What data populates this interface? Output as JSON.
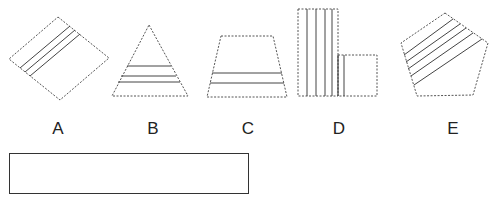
{
  "question": {
    "options": [
      {
        "id": "A",
        "label": "A",
        "shape": "rotated-square",
        "shaded_stripes": 3
      },
      {
        "id": "B",
        "label": "B",
        "shape": "triangle",
        "shaded_stripes": 3
      },
      {
        "id": "C",
        "label": "C",
        "shape": "trapezoid",
        "shaded_stripes": 2
      },
      {
        "id": "D",
        "label": "D",
        "shape": "l-shape",
        "shaded_stripes": 6
      },
      {
        "id": "E",
        "label": "E",
        "shape": "pentagon",
        "shaded_stripes": 5
      }
    ],
    "answer_box": {
      "value": "",
      "placeholder": ""
    }
  },
  "colors": {
    "outline": "#555555",
    "stripe": "#444444",
    "box_border": "#333333"
  }
}
